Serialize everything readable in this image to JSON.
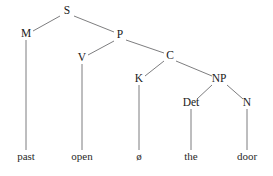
{
  "diagram": {
    "type": "syntax-tree",
    "background_color": "#ffffff",
    "line_color": "#6e6e70",
    "text_color": "#1a1a1a",
    "sentence": "past open ø the door"
  },
  "nodes": [
    {
      "id": "S",
      "label": "S",
      "x": 67,
      "y": 14,
      "kind": "nonterminal"
    },
    {
      "id": "M",
      "label": "M",
      "x": 26,
      "y": 37,
      "kind": "nonterminal"
    },
    {
      "id": "P",
      "label": "P",
      "x": 120,
      "y": 38,
      "kind": "nonterminal"
    },
    {
      "id": "V",
      "label": "V",
      "x": 82,
      "y": 61,
      "kind": "nonterminal"
    },
    {
      "id": "C",
      "label": "C",
      "x": 170,
      "y": 59,
      "kind": "nonterminal"
    },
    {
      "id": "K",
      "label": "K",
      "x": 139,
      "y": 82,
      "kind": "nonterminal"
    },
    {
      "id": "NP",
      "label": "NP",
      "x": 219,
      "y": 82,
      "kind": "nonterminal"
    },
    {
      "id": "Det",
      "label": "Det",
      "x": 191,
      "y": 106,
      "kind": "nonterminal"
    },
    {
      "id": "N",
      "label": "N",
      "x": 247,
      "y": 106,
      "kind": "nonterminal"
    }
  ],
  "leaves": [
    {
      "id": "past",
      "label": "past",
      "x": 26,
      "y": 160,
      "parent": "M"
    },
    {
      "id": "open",
      "label": "open",
      "x": 82,
      "y": 160,
      "parent": "V"
    },
    {
      "id": "zero",
      "label": "ø",
      "x": 139,
      "y": 160,
      "parent": "K"
    },
    {
      "id": "the",
      "label": "the",
      "x": 191,
      "y": 160,
      "parent": "Det"
    },
    {
      "id": "door",
      "label": "door",
      "x": 247,
      "y": 160,
      "parent": "N"
    }
  ],
  "edges": [
    {
      "id": "S-M",
      "from": "S",
      "to": "M",
      "x1": 60,
      "y1": 16,
      "x2": 33,
      "y2": 31
    },
    {
      "id": "S-P",
      "from": "S",
      "to": "P",
      "x1": 74,
      "y1": 16,
      "x2": 114,
      "y2": 32
    },
    {
      "id": "M-past",
      "from": "M",
      "to": "past",
      "x1": 26,
      "y1": 40,
      "x2": 26,
      "y2": 150
    },
    {
      "id": "P-V",
      "from": "P",
      "to": "V",
      "x1": 114,
      "y1": 41,
      "x2": 88,
      "y2": 55
    },
    {
      "id": "P-C",
      "from": "P",
      "to": "C",
      "x1": 126,
      "y1": 40,
      "x2": 164,
      "y2": 53
    },
    {
      "id": "V-open",
      "from": "V",
      "to": "open",
      "x1": 82,
      "y1": 64,
      "x2": 82,
      "y2": 150
    },
    {
      "id": "C-K",
      "from": "C",
      "to": "K",
      "x1": 164,
      "y1": 61,
      "x2": 145,
      "y2": 76
    },
    {
      "id": "C-NP",
      "from": "C",
      "to": "NP",
      "x1": 176,
      "y1": 61,
      "x2": 212,
      "y2": 76
    },
    {
      "id": "K-zero",
      "from": "K",
      "to": "zero",
      "x1": 139,
      "y1": 85,
      "x2": 139,
      "y2": 150
    },
    {
      "id": "NP-Det",
      "from": "NP",
      "to": "Det",
      "x1": 212,
      "y1": 85,
      "x2": 197,
      "y2": 99
    },
    {
      "id": "NP-N",
      "from": "NP",
      "to": "N",
      "x1": 227,
      "y1": 85,
      "x2": 243,
      "y2": 99
    },
    {
      "id": "Det-the",
      "from": "Det",
      "to": "the",
      "x1": 191,
      "y1": 109,
      "x2": 191,
      "y2": 150
    },
    {
      "id": "N-door",
      "from": "N",
      "to": "door",
      "x1": 247,
      "y1": 109,
      "x2": 247,
      "y2": 150
    }
  ]
}
